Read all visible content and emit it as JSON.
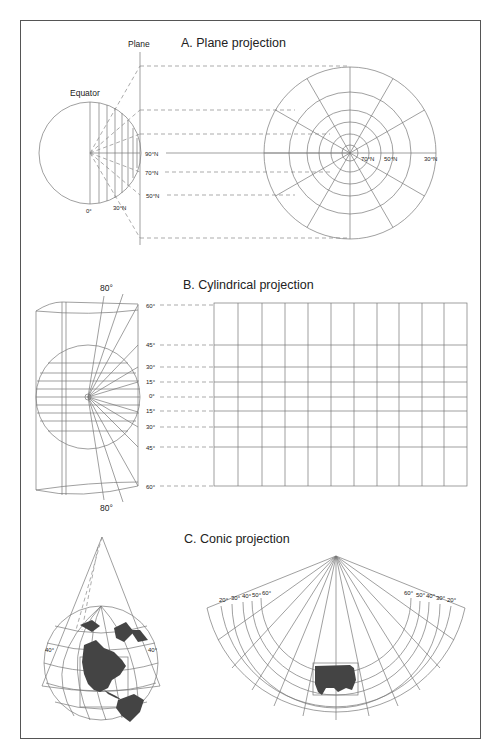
{
  "figure": {
    "sections": [
      {
        "id": "A",
        "title": "A. Plane projection",
        "labels": {
          "plane": "Plane",
          "equator": "Equator",
          "globe_bottom": [
            "0°",
            "30°N"
          ],
          "plane_latitudes": [
            "90°N",
            "70°N",
            "50°N"
          ],
          "polar_latitudes": [
            "70°N",
            "50°N",
            "30°N"
          ]
        }
      },
      {
        "id": "B",
        "title": "B. Cylindrical projection",
        "labels": {
          "top": "80°",
          "bottom": "80°",
          "latitudes": [
            "60°",
            "45°",
            "30°",
            "15°",
            "0°",
            "15°",
            "30°",
            "45°",
            "60°"
          ]
        },
        "grid": {
          "columns": 10,
          "rows": 8
        }
      },
      {
        "id": "C",
        "title": "C. Conic projection",
        "labels": {
          "globe_left": "40°",
          "globe_right": "40°",
          "fan_left": [
            "20°",
            "30°",
            "40°",
            "50°",
            "60°"
          ],
          "fan_right": [
            "60°",
            "50°",
            "40°",
            "30°",
            "20°"
          ]
        }
      }
    ],
    "colors": {
      "line": "#777777",
      "land": "#444444",
      "border": "#555555",
      "text": "#222222"
    }
  }
}
